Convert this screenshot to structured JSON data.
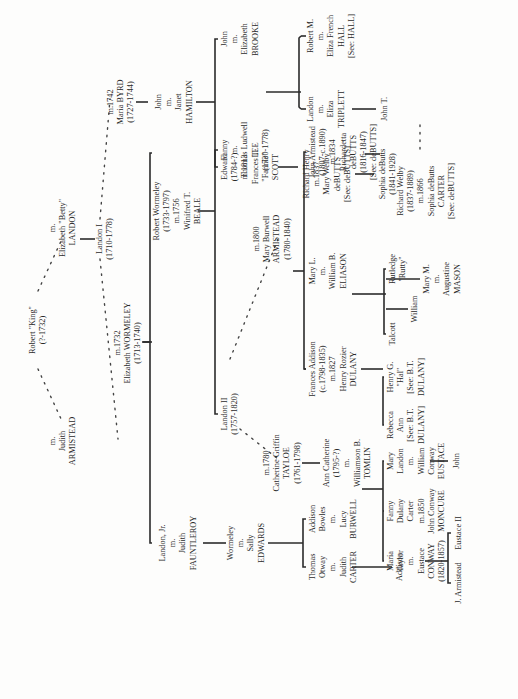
{
  "chart_title": "",
  "nodes": {
    "robert_king": [
      "Robert \"King\"",
      "(?-1732)"
    ],
    "judith_armistead": [
      "m.",
      "Judith",
      "ARMISTEAD"
    ],
    "elizabeth_landon": [
      "m.",
      "Elizabeth \"Betty\"",
      "LANDON"
    ],
    "landon_i": [
      "Landon I",
      "(1710-1778)"
    ],
    "elizabeth_wormeley": [
      "m.1732",
      "Elizabeth WORMELEY",
      "(1713-1740)"
    ],
    "maria_byrd": [
      "m.1742",
      "Maria BYRD",
      "(1727-1744)"
    ],
    "john_hamilton": [
      "John",
      "m.",
      "Janet",
      "HAMILTON"
    ],
    "landon_jr": [
      "Landon, Jr.",
      "m.",
      "Judith",
      "FAUNTLEROY"
    ],
    "robert_wormeley": [
      "Robert Wormeley",
      "(1733-1797)",
      "m.1756",
      "Winifred T.",
      "BEALE"
    ],
    "edward": [
      "Edward",
      "(1784-?)",
      "m.1813",
      "Frances T.",
      "\"Fannie\"",
      "SCOTT"
    ],
    "john_brooke": [
      "John",
      "m.",
      "Elizabeth",
      "BROOKE"
    ],
    "landon_triplett": [
      "Landon",
      "m.",
      "Eliza",
      "TRIPLETT"
    ],
    "robert_m_hall": [
      "Robert M.",
      "m.",
      "Eliza French",
      "HALL",
      "[See: HALL]"
    ],
    "john_t": [
      "John T."
    ],
    "richard_henry": [
      "Richard Henry",
      "m.1837",
      "Mary Welby",
      "deBUTTS",
      "[See: deBUTTS]"
    ],
    "sophia_debutts": [
      "Sophia deButts",
      "(1841-1928)"
    ],
    "wormeley_edwards": [
      "Wormeley",
      "m.",
      "Sally",
      "EDWARDS"
    ],
    "landon_ii": [
      "Landon II",
      "(1757-1820)"
    ],
    "fanny_lee": [
      "Fanny",
      "m.",
      "Thomas Ludwell",
      "LEE",
      "(1730-1778)"
    ],
    "mary_burwell": [
      "m.1800",
      "Mary Burwell",
      "ARMISTEAD",
      "(1780-1840)"
    ],
    "catherine_tayloe": [
      "m.1780",
      "Catherine Griffin",
      "TAYLOE",
      "(1761-1798)"
    ],
    "thomas_carter": [
      "Thomas",
      "Otway",
      "m.",
      "Judith",
      "CARTER"
    ],
    "addison_burwell": [
      "Addison",
      "Bowles",
      "m.",
      "Lucy",
      "BURWELL"
    ],
    "addison": [
      "Addison"
    ],
    "ann_catherine": [
      "Ann Catherine",
      "(1795-?)",
      "m.",
      "Williamson B.",
      "TOMLIN"
    ],
    "frances_addison": [
      "Frances Addison",
      "(c.1798-1835)",
      "m.1827",
      "Henry Rozier",
      "DULANY"
    ],
    "mary_l": [
      "Mary L.",
      "m.",
      "William B.",
      "ELIASON"
    ],
    "john_armistead": [
      "John Armistead",
      "(1807-c.1890)",
      "m.1834",
      "Richardetta",
      "deBUTTS",
      "(1816-1847)",
      "[See: deBUTTS]"
    ],
    "richard_welby": [
      "Richard Welby",
      "(1837-1889)",
      "m.1866",
      "Sophia deButts",
      "CARTER",
      "[See: deBUTTS]"
    ],
    "rebecca_ann": [
      "Rebecca",
      "Ann",
      "[See: B.T.",
      "DULANY]"
    ],
    "henry_g": [
      "Henry G.",
      "\"Hal\"",
      "[See: B.T.",
      "DULANY]"
    ],
    "talcott": [
      "Talcott"
    ],
    "william": [
      "William"
    ],
    "rutledge": [
      "Rutledge",
      "\"Rutty\""
    ],
    "mary_m": [
      "Mary M.",
      "m.",
      "Augustine",
      "MASON"
    ],
    "maria_taylor": [
      "Maria",
      "Taylor",
      "m.",
      "Eustace",
      "CONWAY",
      "(1820-1857)"
    ],
    "fanny_moncure": [
      "Fanny",
      "Dulany",
      "Carter",
      "m.1850",
      "John Conway",
      "MONCURE"
    ],
    "mary_landon": [
      "Mary",
      "Landon",
      "m.",
      "William",
      "Conway",
      "EUSTACE"
    ],
    "john": [
      "John"
    ],
    "j_armistead": [
      "J. Armistead"
    ],
    "eustace_ii": [
      "Eustace II"
    ]
  }
}
